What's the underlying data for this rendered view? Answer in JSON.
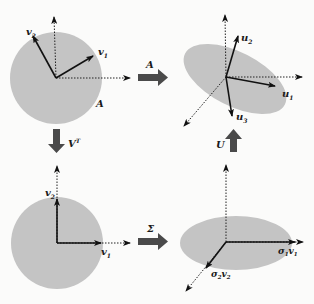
{
  "colors": {
    "shape_fill": "#c4c4c4",
    "arrow_fill": "#4a4a4a",
    "vector": "#111111",
    "axis": "#222222",
    "background": "#fbfbfa"
  },
  "panels": {
    "top_left": {
      "shape": "unit-circle",
      "vectors": [
        {
          "label": "v",
          "sub": "1"
        },
        {
          "label": "v",
          "sub": "2"
        }
      ],
      "shape_label": "A"
    },
    "top_right": {
      "shape": "rotated-ellipse",
      "vectors": [
        {
          "label": "u",
          "sub": "1"
        },
        {
          "label": "u",
          "sub": "2"
        },
        {
          "label": "u",
          "sub": "3"
        }
      ]
    },
    "bottom_left": {
      "shape": "unit-circle-axis-aligned",
      "vectors": [
        {
          "label": "v",
          "sub": "1"
        },
        {
          "label": "v",
          "sub": "2"
        }
      ]
    },
    "bottom_right": {
      "shape": "axis-aligned-ellipse",
      "vectors": [
        {
          "label": "σ",
          "sub": "1",
          "label2": "v",
          "sub2": "1"
        },
        {
          "label": "σ",
          "sub": "2",
          "label2": "v",
          "sub2": "2"
        }
      ]
    }
  },
  "transforms": {
    "a_arrow": {
      "label": "A",
      "direction": "right"
    },
    "vt_arrow": {
      "label": "V",
      "sup": "T",
      "direction": "down"
    },
    "sigma_arrow": {
      "label": "Σ",
      "direction": "right"
    },
    "u_arrow": {
      "label": "U",
      "direction": "up"
    }
  }
}
